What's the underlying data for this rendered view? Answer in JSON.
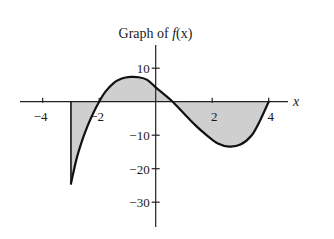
{
  "chart_data": {
    "type": "line",
    "title": "Graph of f(x)",
    "title_parts": {
      "prefix": "Graph of ",
      "func": "f",
      "arg": "(x)"
    },
    "xlabel": "x",
    "ylabel": "",
    "xlim": [
      -4.5,
      4.7
    ],
    "ylim": [
      -37,
      17
    ],
    "grid": false,
    "legend": null,
    "x_ticks": [
      -4,
      -2,
      2,
      4
    ],
    "x_tick_labels": [
      "−4",
      "−2",
      "2",
      "4"
    ],
    "y_ticks": [
      10,
      -10,
      -20,
      -30
    ],
    "y_tick_labels": [
      "10",
      "−10",
      "−20",
      "−30"
    ],
    "shaded_region": "area between f(x) and the x-axis for x in [-3, 4]",
    "fill_color": "#cfcfcf",
    "line_color": "#111111",
    "series": [
      {
        "name": "f(x)",
        "x": [
          -3,
          -2.8,
          -2.6,
          -2.4,
          -2.2,
          -2,
          -1.8,
          -1.5,
          -1.2,
          -0.9,
          -0.6,
          -0.3,
          0,
          0.3,
          0.6,
          1,
          1.4,
          1.8,
          2.2,
          2.6,
          3,
          3.4,
          3.7,
          4
        ],
        "values": [
          -24.5,
          -17,
          -11.5,
          -7,
          -3.2,
          0,
          2.8,
          5.5,
          6.9,
          7.4,
          7.3,
          6.5,
          4.3,
          2.2,
          0,
          -3.5,
          -7,
          -10,
          -12.5,
          -13.4,
          -12.8,
          -10,
          -5.5,
          0
        ]
      }
    ],
    "annotations": [
      {
        "type": "vertical_segment",
        "x": -3,
        "from": 0,
        "to": -24.5
      }
    ],
    "key_points": {
      "zeros": [
        -2,
        0.6,
        4
      ],
      "local_max": {
        "x": -0.8,
        "y": 7.4
      },
      "local_min": {
        "x": 2.6,
        "y": -13.4
      },
      "left_endpoint": {
        "x": -3,
        "y": -24.5
      },
      "y_intercept": 4.3
    }
  }
}
